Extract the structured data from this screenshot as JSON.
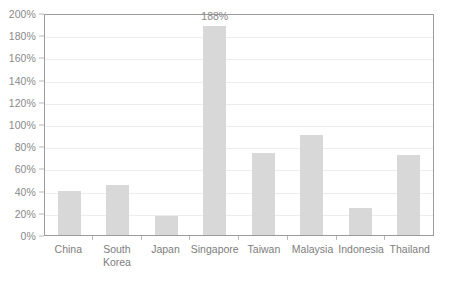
{
  "chart_data": {
    "type": "bar",
    "title": "",
    "xlabel": "",
    "ylabel": "",
    "ylim": [
      0,
      200
    ],
    "ytick_step": 20,
    "grid": true,
    "legend": false,
    "unit": "%",
    "categories": [
      "China",
      "South Korea",
      "Japan",
      "Singapore",
      "Taiwan",
      "Malaysia",
      "Indonesia",
      "Thailand"
    ],
    "values": [
      40,
      45,
      17,
      188,
      74,
      90,
      24,
      72
    ],
    "ytick_labels": [
      "0%",
      "20%",
      "40%",
      "60%",
      "80%",
      "100%",
      "120%",
      "140%",
      "160%",
      "180%",
      "200%"
    ],
    "annotations": [
      {
        "category": "Singapore",
        "text": "188%"
      }
    ],
    "colors": {
      "bar_fill": "#d8d8d8",
      "plot_border": "#9b9b9b",
      "gridline": "#ededed",
      "tick_label": "#8a8a8a",
      "category_label": "#7d7d7d",
      "background": "#ffffff"
    }
  }
}
